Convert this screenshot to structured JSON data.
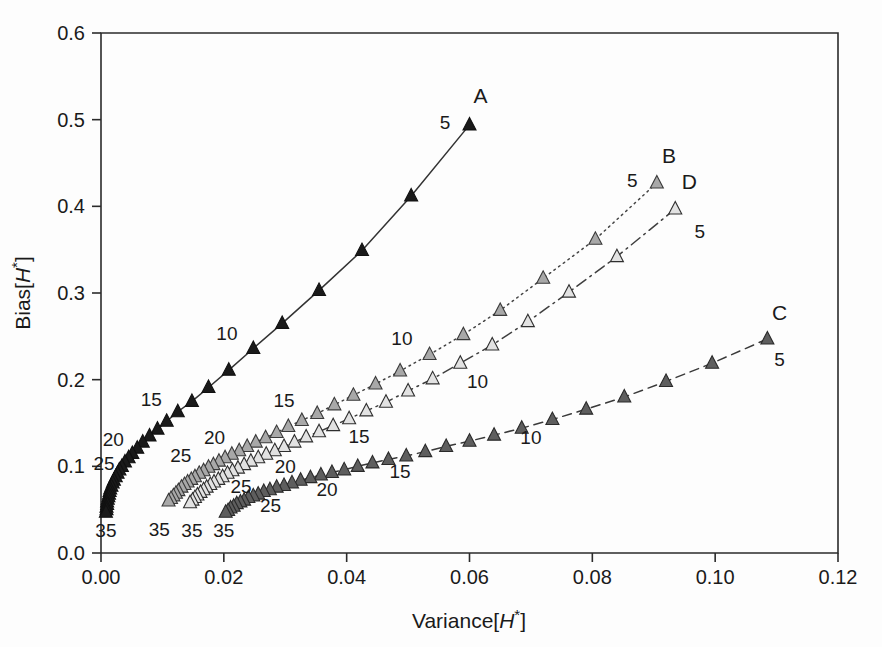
{
  "chart_data": {
    "type": "scatter",
    "title": "",
    "xlabel": "Variance[H*]",
    "ylabel": "Bias[H*]",
    "xlim": [
      0.0,
      0.12
    ],
    "ylim": [
      0.0,
      0.6
    ],
    "xticks": [
      "0.00",
      "0.02",
      "0.04",
      "0.06",
      "0.08",
      "0.10",
      "0.12"
    ],
    "xtickvalues": [
      0.0,
      0.02,
      0.04,
      0.06,
      0.08,
      0.1,
      0.12
    ],
    "yticks": [
      "0.0",
      "0.1",
      "0.2",
      "0.3",
      "0.4",
      "0.5",
      "0.6"
    ],
    "ytickvalues": [
      0.0,
      0.1,
      0.2,
      0.3,
      0.4,
      0.5,
      0.6
    ],
    "grid": false,
    "legend_position": "inline-end-of-curve",
    "point_label_meaning": "sample size parameter annotated at selected points",
    "series": [
      {
        "name": "A",
        "label": "A",
        "marker": "triangle-up",
        "marker_fill": "#1a1a1a",
        "marker_edge": "#111111",
        "linestyle": "solid",
        "line_color": "#333333",
        "points": [
          {
            "x": 0.06,
            "y": 0.494,
            "label": "5"
          },
          {
            "x": 0.0505,
            "y": 0.412,
            "label": ""
          },
          {
            "x": 0.0425,
            "y": 0.349,
            "label": ""
          },
          {
            "x": 0.0355,
            "y": 0.303,
            "label": ""
          },
          {
            "x": 0.0295,
            "y": 0.265,
            "label": ""
          },
          {
            "x": 0.0248,
            "y": 0.236,
            "label": "10"
          },
          {
            "x": 0.0208,
            "y": 0.211,
            "label": ""
          },
          {
            "x": 0.0175,
            "y": 0.191,
            "label": ""
          },
          {
            "x": 0.0148,
            "y": 0.175,
            "label": ""
          },
          {
            "x": 0.0125,
            "y": 0.163,
            "label": "15"
          },
          {
            "x": 0.0107,
            "y": 0.152,
            "label": ""
          },
          {
            "x": 0.0092,
            "y": 0.143,
            "label": ""
          },
          {
            "x": 0.0079,
            "y": 0.135,
            "label": ""
          },
          {
            "x": 0.0068,
            "y": 0.128,
            "label": ""
          },
          {
            "x": 0.0059,
            "y": 0.121,
            "label": "20"
          },
          {
            "x": 0.0051,
            "y": 0.115,
            "label": ""
          },
          {
            "x": 0.0045,
            "y": 0.11,
            "label": ""
          },
          {
            "x": 0.0039,
            "y": 0.105,
            "label": ""
          },
          {
            "x": 0.0034,
            "y": 0.1,
            "label": ""
          },
          {
            "x": 0.003,
            "y": 0.096,
            "label": "25"
          },
          {
            "x": 0.0027,
            "y": 0.092,
            "label": ""
          },
          {
            "x": 0.0024,
            "y": 0.088,
            "label": ""
          },
          {
            "x": 0.0021,
            "y": 0.084,
            "label": ""
          },
          {
            "x": 0.0019,
            "y": 0.081,
            "label": ""
          },
          {
            "x": 0.0017,
            "y": 0.077,
            "label": ""
          },
          {
            "x": 0.0015,
            "y": 0.074,
            "label": ""
          },
          {
            "x": 0.0014,
            "y": 0.071,
            "label": ""
          },
          {
            "x": 0.0013,
            "y": 0.068,
            "label": ""
          },
          {
            "x": 0.0012,
            "y": 0.065,
            "label": ""
          },
          {
            "x": 0.0011,
            "y": 0.062,
            "label": ""
          },
          {
            "x": 0.001,
            "y": 0.059,
            "label": ""
          },
          {
            "x": 0.001,
            "y": 0.056,
            "label": ""
          },
          {
            "x": 0.0009,
            "y": 0.053,
            "label": ""
          },
          {
            "x": 0.0009,
            "y": 0.05,
            "label": ""
          },
          {
            "x": 0.0008,
            "y": 0.047,
            "label": "35"
          }
        ]
      },
      {
        "name": "B",
        "label": "B",
        "marker": "triangle-up",
        "marker_fill": "#a8a8a8",
        "marker_edge": "#3a3a3a",
        "linestyle": "dotted",
        "line_color": "#444444",
        "points": [
          {
            "x": 0.0905,
            "y": 0.427,
            "label": "5"
          },
          {
            "x": 0.0805,
            "y": 0.362,
            "label": ""
          },
          {
            "x": 0.072,
            "y": 0.317,
            "label": ""
          },
          {
            "x": 0.065,
            "y": 0.28,
            "label": ""
          },
          {
            "x": 0.059,
            "y": 0.252,
            "label": ""
          },
          {
            "x": 0.0535,
            "y": 0.229,
            "label": "10"
          },
          {
            "x": 0.0487,
            "y": 0.21,
            "label": ""
          },
          {
            "x": 0.0447,
            "y": 0.195,
            "label": ""
          },
          {
            "x": 0.0411,
            "y": 0.182,
            "label": ""
          },
          {
            "x": 0.038,
            "y": 0.171,
            "label": ""
          },
          {
            "x": 0.0352,
            "y": 0.161,
            "label": "15"
          },
          {
            "x": 0.0327,
            "y": 0.153,
            "label": ""
          },
          {
            "x": 0.0305,
            "y": 0.146,
            "label": ""
          },
          {
            "x": 0.0286,
            "y": 0.139,
            "label": ""
          },
          {
            "x": 0.0268,
            "y": 0.133,
            "label": ""
          },
          {
            "x": 0.0252,
            "y": 0.128,
            "label": "20"
          },
          {
            "x": 0.0238,
            "y": 0.123,
            "label": ""
          },
          {
            "x": 0.0225,
            "y": 0.118,
            "label": ""
          },
          {
            "x": 0.0213,
            "y": 0.114,
            "label": ""
          },
          {
            "x": 0.0202,
            "y": 0.11,
            "label": ""
          },
          {
            "x": 0.0192,
            "y": 0.106,
            "label": "25"
          },
          {
            "x": 0.0183,
            "y": 0.102,
            "label": ""
          },
          {
            "x": 0.0175,
            "y": 0.099,
            "label": ""
          },
          {
            "x": 0.0167,
            "y": 0.095,
            "label": ""
          },
          {
            "x": 0.016,
            "y": 0.092,
            "label": ""
          },
          {
            "x": 0.0153,
            "y": 0.088,
            "label": ""
          },
          {
            "x": 0.0147,
            "y": 0.085,
            "label": ""
          },
          {
            "x": 0.0141,
            "y": 0.082,
            "label": ""
          },
          {
            "x": 0.0136,
            "y": 0.079,
            "label": ""
          },
          {
            "x": 0.0131,
            "y": 0.076,
            "label": ""
          },
          {
            "x": 0.0126,
            "y": 0.072,
            "label": ""
          },
          {
            "x": 0.0122,
            "y": 0.069,
            "label": ""
          },
          {
            "x": 0.0118,
            "y": 0.066,
            "label": ""
          },
          {
            "x": 0.0114,
            "y": 0.063,
            "label": ""
          },
          {
            "x": 0.011,
            "y": 0.06,
            "label": "35"
          }
        ]
      },
      {
        "name": "C",
        "label": "C",
        "marker": "triangle-up",
        "marker_fill": "#5e5e5e",
        "marker_edge": "#2a2a2a",
        "linestyle": "dashed",
        "line_color": "#3a3a3a",
        "points": [
          {
            "x": 0.1085,
            "y": 0.247,
            "label": "5"
          },
          {
            "x": 0.0995,
            "y": 0.219,
            "label": ""
          },
          {
            "x": 0.092,
            "y": 0.198,
            "label": ""
          },
          {
            "x": 0.0852,
            "y": 0.18,
            "label": ""
          },
          {
            "x": 0.079,
            "y": 0.166,
            "label": ""
          },
          {
            "x": 0.0735,
            "y": 0.154,
            "label": "10"
          },
          {
            "x": 0.0685,
            "y": 0.144,
            "label": ""
          },
          {
            "x": 0.064,
            "y": 0.136,
            "label": ""
          },
          {
            "x": 0.06,
            "y": 0.129,
            "label": ""
          },
          {
            "x": 0.0562,
            "y": 0.123,
            "label": ""
          },
          {
            "x": 0.0528,
            "y": 0.117,
            "label": "15"
          },
          {
            "x": 0.0497,
            "y": 0.112,
            "label": ""
          },
          {
            "x": 0.0468,
            "y": 0.108,
            "label": ""
          },
          {
            "x": 0.0442,
            "y": 0.104,
            "label": ""
          },
          {
            "x": 0.0418,
            "y": 0.1,
            "label": ""
          },
          {
            "x": 0.0396,
            "y": 0.096,
            "label": "20"
          },
          {
            "x": 0.0376,
            "y": 0.093,
            "label": ""
          },
          {
            "x": 0.0358,
            "y": 0.09,
            "label": ""
          },
          {
            "x": 0.0341,
            "y": 0.087,
            "label": ""
          },
          {
            "x": 0.0325,
            "y": 0.084,
            "label": ""
          },
          {
            "x": 0.0311,
            "y": 0.081,
            "label": "25"
          },
          {
            "x": 0.0298,
            "y": 0.078,
            "label": ""
          },
          {
            "x": 0.0286,
            "y": 0.076,
            "label": ""
          },
          {
            "x": 0.0275,
            "y": 0.073,
            "label": ""
          },
          {
            "x": 0.0265,
            "y": 0.071,
            "label": ""
          },
          {
            "x": 0.0256,
            "y": 0.068,
            "label": ""
          },
          {
            "x": 0.0248,
            "y": 0.066,
            "label": ""
          },
          {
            "x": 0.024,
            "y": 0.064,
            "label": ""
          },
          {
            "x": 0.0233,
            "y": 0.061,
            "label": ""
          },
          {
            "x": 0.0227,
            "y": 0.059,
            "label": ""
          },
          {
            "x": 0.0221,
            "y": 0.057,
            "label": ""
          },
          {
            "x": 0.0216,
            "y": 0.054,
            "label": ""
          },
          {
            "x": 0.0211,
            "y": 0.052,
            "label": ""
          },
          {
            "x": 0.0207,
            "y": 0.049,
            "label": ""
          },
          {
            "x": 0.0203,
            "y": 0.047,
            "label": "35"
          }
        ]
      },
      {
        "name": "D",
        "label": "D",
        "marker": "triangle-up",
        "marker_fill": "#e2e2e2",
        "marker_edge": "#2f2f2f",
        "linestyle": "dashdot",
        "line_color": "#3f3f3f",
        "points": [
          {
            "x": 0.0935,
            "y": 0.397,
            "label": "5"
          },
          {
            "x": 0.084,
            "y": 0.342,
            "label": ""
          },
          {
            "x": 0.0762,
            "y": 0.301,
            "label": ""
          },
          {
            "x": 0.0695,
            "y": 0.267,
            "label": ""
          },
          {
            "x": 0.0637,
            "y": 0.24,
            "label": ""
          },
          {
            "x": 0.0585,
            "y": 0.219,
            "label": "10"
          },
          {
            "x": 0.054,
            "y": 0.201,
            "label": ""
          },
          {
            "x": 0.05,
            "y": 0.187,
            "label": ""
          },
          {
            "x": 0.0464,
            "y": 0.174,
            "label": ""
          },
          {
            "x": 0.0432,
            "y": 0.164,
            "label": ""
          },
          {
            "x": 0.0404,
            "y": 0.155,
            "label": "15"
          },
          {
            "x": 0.0378,
            "y": 0.147,
            "label": ""
          },
          {
            "x": 0.0355,
            "y": 0.14,
            "label": ""
          },
          {
            "x": 0.0334,
            "y": 0.134,
            "label": ""
          },
          {
            "x": 0.0315,
            "y": 0.128,
            "label": ""
          },
          {
            "x": 0.0298,
            "y": 0.123,
            "label": "20"
          },
          {
            "x": 0.0283,
            "y": 0.118,
            "label": ""
          },
          {
            "x": 0.0269,
            "y": 0.114,
            "label": ""
          },
          {
            "x": 0.0256,
            "y": 0.11,
            "label": ""
          },
          {
            "x": 0.0244,
            "y": 0.106,
            "label": ""
          },
          {
            "x": 0.0233,
            "y": 0.102,
            "label": "25"
          },
          {
            "x": 0.0223,
            "y": 0.098,
            "label": ""
          },
          {
            "x": 0.0214,
            "y": 0.095,
            "label": ""
          },
          {
            "x": 0.0206,
            "y": 0.092,
            "label": ""
          },
          {
            "x": 0.0198,
            "y": 0.088,
            "label": ""
          },
          {
            "x": 0.0191,
            "y": 0.085,
            "label": ""
          },
          {
            "x": 0.0184,
            "y": 0.082,
            "label": ""
          },
          {
            "x": 0.0178,
            "y": 0.079,
            "label": ""
          },
          {
            "x": 0.0172,
            "y": 0.076,
            "label": ""
          },
          {
            "x": 0.0167,
            "y": 0.073,
            "label": ""
          },
          {
            "x": 0.0162,
            "y": 0.07,
            "label": ""
          },
          {
            "x": 0.0157,
            "y": 0.067,
            "label": ""
          },
          {
            "x": 0.0153,
            "y": 0.064,
            "label": ""
          },
          {
            "x": 0.0149,
            "y": 0.061,
            "label": ""
          },
          {
            "x": 0.0145,
            "y": 0.058,
            "label": "35"
          }
        ]
      }
    ],
    "series_end_labels": [
      {
        "name": "A",
        "text": "A",
        "x": 0.0618,
        "y": 0.527
      },
      {
        "name": "B",
        "text": "B",
        "x": 0.0925,
        "y": 0.458
      },
      {
        "name": "C",
        "text": "C",
        "x": 0.1105,
        "y": 0.277
      },
      {
        "name": "D",
        "text": "D",
        "x": 0.0958,
        "y": 0.428
      }
    ],
    "annotations": [
      {
        "series": "A",
        "text": "5",
        "x": 0.056,
        "y": 0.497
      },
      {
        "series": "A",
        "text": "10",
        "x": 0.0205,
        "y": 0.254
      },
      {
        "series": "A",
        "text": "15",
        "x": 0.0082,
        "y": 0.178
      },
      {
        "series": "A",
        "text": "20",
        "x": 0.002,
        "y": 0.131
      },
      {
        "series": "A",
        "text": "25",
        "x": 0.0005,
        "y": 0.104
      },
      {
        "series": "A",
        "text": "35",
        "x": 0.0008,
        "y": 0.027
      },
      {
        "series": "B",
        "text": "5",
        "x": 0.0865,
        "y": 0.43
      },
      {
        "series": "B",
        "text": "10",
        "x": 0.049,
        "y": 0.248
      },
      {
        "series": "B",
        "text": "15",
        "x": 0.0298,
        "y": 0.176
      },
      {
        "series": "B",
        "text": "20",
        "x": 0.0185,
        "y": 0.134
      },
      {
        "series": "B",
        "text": "25",
        "x": 0.013,
        "y": 0.113
      },
      {
        "series": "B",
        "text": "35",
        "x": 0.0095,
        "y": 0.028
      },
      {
        "series": "C",
        "text": "5",
        "x": 0.1105,
        "y": 0.224
      },
      {
        "series": "C",
        "text": "10",
        "x": 0.07,
        "y": 0.134
      },
      {
        "series": "C",
        "text": "15",
        "x": 0.0487,
        "y": 0.095
      },
      {
        "series": "C",
        "text": "20",
        "x": 0.0368,
        "y": 0.074
      },
      {
        "series": "C",
        "text": "25",
        "x": 0.0276,
        "y": 0.055
      },
      {
        "series": "C",
        "text": "35",
        "x": 0.02,
        "y": 0.027
      },
      {
        "series": "D",
        "text": "5",
        "x": 0.0975,
        "y": 0.372
      },
      {
        "series": "D",
        "text": "10",
        "x": 0.0613,
        "y": 0.198
      },
      {
        "series": "D",
        "text": "15",
        "x": 0.042,
        "y": 0.135
      },
      {
        "series": "D",
        "text": "20",
        "x": 0.03,
        "y": 0.1
      },
      {
        "series": "D",
        "text": "25",
        "x": 0.0228,
        "y": 0.077
      },
      {
        "series": "D",
        "text": "35",
        "x": 0.0148,
        "y": 0.027
      }
    ]
  }
}
